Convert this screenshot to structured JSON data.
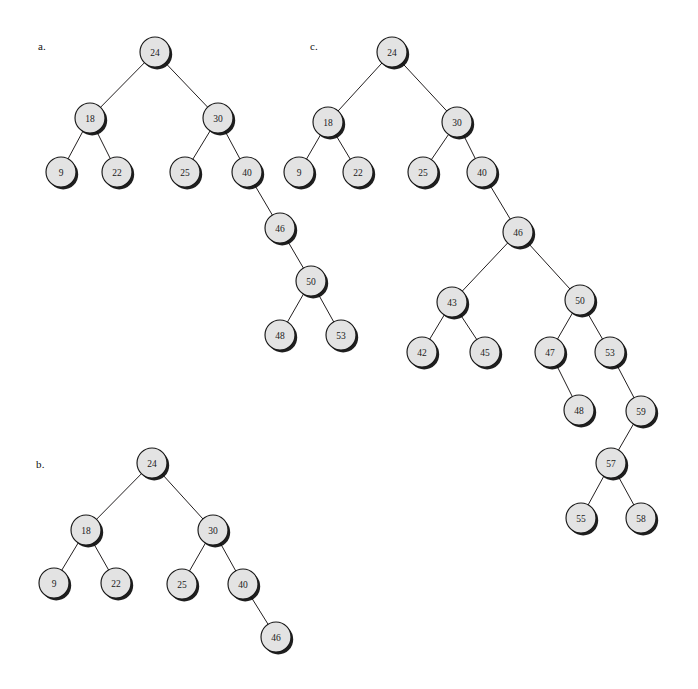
{
  "figure": {
    "background_color": "#ffffff",
    "node_fill_color": "#e3e3e3",
    "node_stroke_color": "#181818",
    "edge_color": "#231f20",
    "node_radius": 15,
    "width": 698,
    "height": 689
  },
  "panels": [
    {
      "id": "panel-a",
      "label": "a.",
      "label_x": 38,
      "label_y": 40,
      "nodes": [
        {
          "id": "a24",
          "value": "24",
          "x": 155,
          "y": 52
        },
        {
          "id": "a18",
          "value": "18",
          "x": 90,
          "y": 118
        },
        {
          "id": "a30",
          "value": "30",
          "x": 218,
          "y": 118
        },
        {
          "id": "a9",
          "value": "9",
          "x": 61,
          "y": 172
        },
        {
          "id": "a22",
          "value": "22",
          "x": 117,
          "y": 172
        },
        {
          "id": "a25",
          "value": "25",
          "x": 185,
          "y": 172
        },
        {
          "id": "a40",
          "value": "40",
          "x": 247,
          "y": 172
        },
        {
          "id": "a46",
          "value": "46",
          "x": 280,
          "y": 228
        },
        {
          "id": "a50",
          "value": "50",
          "x": 311,
          "y": 281
        },
        {
          "id": "a48",
          "value": "48",
          "x": 280,
          "y": 335
        },
        {
          "id": "a53",
          "value": "53",
          "x": 341,
          "y": 335
        }
      ],
      "edges": [
        [
          "a24",
          "a18"
        ],
        [
          "a24",
          "a30"
        ],
        [
          "a18",
          "a9"
        ],
        [
          "a18",
          "a22"
        ],
        [
          "a30",
          "a25"
        ],
        [
          "a30",
          "a40"
        ],
        [
          "a40",
          "a46"
        ],
        [
          "a46",
          "a50"
        ],
        [
          "a50",
          "a48"
        ],
        [
          "a50",
          "a53"
        ]
      ]
    },
    {
      "id": "panel-b",
      "label": "b.",
      "label_x": 36,
      "label_y": 458,
      "nodes": [
        {
          "id": "b24",
          "value": "24",
          "x": 152,
          "y": 463
        },
        {
          "id": "b18",
          "value": "18",
          "x": 86,
          "y": 530
        },
        {
          "id": "b30",
          "value": "30",
          "x": 213,
          "y": 530
        },
        {
          "id": "b9",
          "value": "9",
          "x": 54,
          "y": 583
        },
        {
          "id": "b22",
          "value": "22",
          "x": 116,
          "y": 583
        },
        {
          "id": "b25",
          "value": "25",
          "x": 182,
          "y": 584
        },
        {
          "id": "b40",
          "value": "40",
          "x": 243,
          "y": 584
        },
        {
          "id": "b46",
          "value": "46",
          "x": 276,
          "y": 637
        }
      ],
      "edges": [
        [
          "b24",
          "b18"
        ],
        [
          "b24",
          "b30"
        ],
        [
          "b18",
          "b9"
        ],
        [
          "b18",
          "b22"
        ],
        [
          "b30",
          "b25"
        ],
        [
          "b30",
          "b40"
        ],
        [
          "b40",
          "b46"
        ]
      ]
    },
    {
      "id": "panel-c",
      "label": "c.",
      "label_x": 310,
      "label_y": 40,
      "nodes": [
        {
          "id": "c24",
          "value": "24",
          "x": 392,
          "y": 52
        },
        {
          "id": "c18",
          "value": "18",
          "x": 328,
          "y": 122
        },
        {
          "id": "c30",
          "value": "30",
          "x": 457,
          "y": 122
        },
        {
          "id": "c9",
          "value": "9",
          "x": 299,
          "y": 172
        },
        {
          "id": "c22",
          "value": "22",
          "x": 358,
          "y": 172
        },
        {
          "id": "c25",
          "value": "25",
          "x": 423,
          "y": 172
        },
        {
          "id": "c40",
          "value": "40",
          "x": 482,
          "y": 172
        },
        {
          "id": "c46",
          "value": "46",
          "x": 518,
          "y": 232
        },
        {
          "id": "c43",
          "value": "43",
          "x": 452,
          "y": 302
        },
        {
          "id": "c50",
          "value": "50",
          "x": 580,
          "y": 300
        },
        {
          "id": "c42",
          "value": "42",
          "x": 422,
          "y": 352
        },
        {
          "id": "c45",
          "value": "45",
          "x": 485,
          "y": 352
        },
        {
          "id": "c47",
          "value": "47",
          "x": 550,
          "y": 352
        },
        {
          "id": "c53",
          "value": "53",
          "x": 610,
          "y": 352
        },
        {
          "id": "c48",
          "value": "48",
          "x": 579,
          "y": 410
        },
        {
          "id": "c59",
          "value": "59",
          "x": 641,
          "y": 411
        },
        {
          "id": "c57",
          "value": "57",
          "x": 611,
          "y": 463
        },
        {
          "id": "c55",
          "value": "55",
          "x": 581,
          "y": 518
        },
        {
          "id": "c58",
          "value": "58",
          "x": 641,
          "y": 518
        }
      ],
      "edges": [
        [
          "c24",
          "c18"
        ],
        [
          "c24",
          "c30"
        ],
        [
          "c18",
          "c9"
        ],
        [
          "c18",
          "c22"
        ],
        [
          "c30",
          "c25"
        ],
        [
          "c30",
          "c40"
        ],
        [
          "c40",
          "c46"
        ],
        [
          "c46",
          "c43"
        ],
        [
          "c46",
          "c50"
        ],
        [
          "c43",
          "c42"
        ],
        [
          "c43",
          "c45"
        ],
        [
          "c50",
          "c47"
        ],
        [
          "c50",
          "c53"
        ],
        [
          "c47",
          "c48"
        ],
        [
          "c53",
          "c59"
        ],
        [
          "c59",
          "c57"
        ],
        [
          "c57",
          "c55"
        ],
        [
          "c57",
          "c58"
        ]
      ]
    }
  ]
}
